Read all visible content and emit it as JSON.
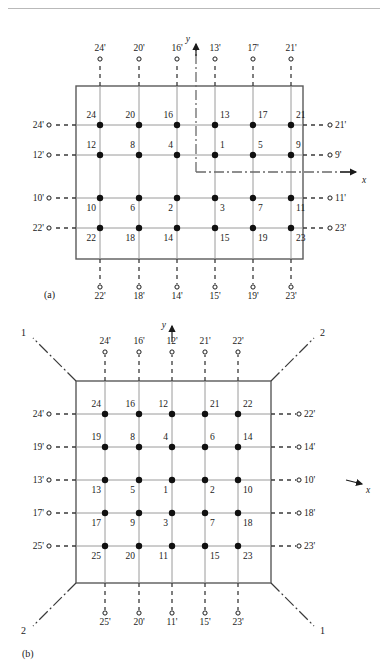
{
  "figure": {
    "caption_a": "(a)",
    "caption_b": "(b)",
    "axis_x": "x",
    "axis_y": "y"
  },
  "panel_a": {
    "label": "(a)",
    "grid_cols": 6,
    "grid_rows": 4,
    "nodes": [
      [
        "24",
        "20",
        "16",
        "13",
        "17",
        "21"
      ],
      [
        "12",
        "8",
        "4",
        "1",
        "5",
        "9"
      ],
      [
        "10",
        "6",
        "2",
        "3",
        "7",
        "11"
      ],
      [
        "22",
        "18",
        "14",
        "15",
        "19",
        "23"
      ]
    ],
    "node_label_side": [
      [
        "above",
        "above",
        "above",
        "above",
        "above",
        "above"
      ],
      [
        "above",
        "above",
        "above",
        "above",
        "above",
        "above"
      ],
      [
        "below",
        "below",
        "below",
        "below",
        "below",
        "below"
      ],
      [
        "below",
        "below",
        "below",
        "below",
        "below",
        "below"
      ]
    ],
    "top_ports": [
      "24'",
      "20'",
      "16'",
      "13'",
      "17'",
      "21'"
    ],
    "bottom_ports": [
      "22'",
      "18'",
      "14'",
      "15'",
      "19'",
      "23'"
    ],
    "left_ports": [
      "24'",
      "12'",
      "10'",
      "22'"
    ],
    "right_ports": [
      "21'",
      "9'",
      "11'",
      "23'"
    ]
  },
  "panel_b": {
    "label": "(b)",
    "grid_cols": 5,
    "grid_rows": 5,
    "nodes": [
      [
        "24",
        "16",
        "12",
        "21",
        "22"
      ],
      [
        "19",
        "8",
        "4",
        "6",
        "14"
      ],
      [
        "13",
        "5",
        "1",
        "2",
        "10"
      ],
      [
        "17",
        "9",
        "3",
        "7",
        "18"
      ],
      [
        "25",
        "20",
        "11",
        "15",
        "23"
      ]
    ],
    "node_label_side": [
      [
        "above",
        "above",
        "above",
        "above",
        "above"
      ],
      [
        "above",
        "above",
        "above",
        "above",
        "above"
      ],
      [
        "below",
        "below",
        "below",
        "below",
        "below"
      ],
      [
        "below",
        "below",
        "below",
        "below",
        "below"
      ],
      [
        "below",
        "below",
        "below",
        "below",
        "below"
      ]
    ],
    "top_ports": [
      "24'",
      "16'",
      "12'",
      "21'",
      "22'"
    ],
    "bottom_ports": [
      "25'",
      "20'",
      "11'",
      "15'",
      "23'"
    ],
    "left_ports": [
      "24'",
      "19'",
      "13'",
      "17'",
      "25'"
    ],
    "right_ports": [
      "22'",
      "14'",
      "10'",
      "18'",
      "23'"
    ],
    "corner_top_left": "1",
    "corner_top_right": "2",
    "corner_bottom_left": "2",
    "corner_bottom_right": "1"
  },
  "colors": {
    "ink": "#1a1a1a",
    "frame": "#5a5a5a",
    "grid": "#8a8a8a",
    "dashed": "#3a3a3a",
    "rule": "#b9b9b9"
  }
}
